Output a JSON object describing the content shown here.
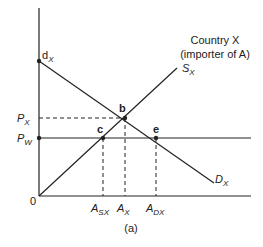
{
  "diagram": {
    "title": "Country X (importer of A)",
    "title_line1": "Country X",
    "title_line2": "(importer of A)",
    "caption": "(a)",
    "origin_label": "0",
    "price_labels": {
      "px": "P",
      "px_sub": "X",
      "pw": "P",
      "pw_sub": "W"
    },
    "quantity_labels": {
      "asx": "A",
      "asx_sub": "SX",
      "ax": "A",
      "ax_sub": "X",
      "adx": "A",
      "adx_sub": "DX"
    },
    "curves": {
      "supply": "S",
      "supply_sub": "X",
      "demand": "D",
      "demand_sub": "X",
      "demand_intercept": "d",
      "demand_intercept_sub": "X"
    },
    "points": {
      "b": "b",
      "c": "c",
      "e": "e"
    },
    "colors": {
      "line": "#222222",
      "background": "#ffffff"
    }
  }
}
